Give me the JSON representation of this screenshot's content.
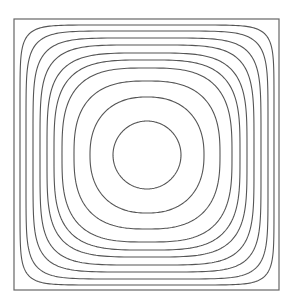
{
  "chart_data": {
    "type": "contour",
    "title": "",
    "xlabel": "",
    "ylabel": "",
    "grid": false,
    "legend": null,
    "frame": {
      "left": 14,
      "top": 19,
      "right": 279,
      "bottom": 290
    },
    "center": {
      "x": 147,
      "y": 155
    },
    "line_color": "#555555",
    "contours": [
      {
        "level": 1,
        "half_width": 34,
        "half_height": 34,
        "exponent": 2.0
      },
      {
        "level": 2,
        "half_width": 57,
        "half_height": 58,
        "exponent": 2.3
      },
      {
        "level": 3,
        "half_width": 73,
        "half_height": 74,
        "exponent": 2.7
      },
      {
        "level": 4,
        "half_width": 85,
        "half_height": 87,
        "exponent": 3.1
      },
      {
        "level": 5,
        "half_width": 93,
        "half_height": 95,
        "exponent": 3.5
      },
      {
        "level": 6,
        "half_width": 100,
        "half_height": 102,
        "exponent": 4.0
      },
      {
        "level": 7,
        "half_width": 107,
        "half_height": 110,
        "exponent": 4.7
      },
      {
        "level": 8,
        "half_width": 114,
        "half_height": 117,
        "exponent": 5.6
      },
      {
        "level": 9,
        "half_width": 121,
        "half_height": 124,
        "exponent": 7.0
      },
      {
        "level": 10,
        "half_width": 127,
        "half_height": 130,
        "exponent": 9.5
      }
    ]
  }
}
